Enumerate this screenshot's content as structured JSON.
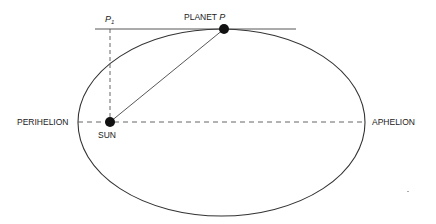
{
  "diagram": {
    "labels": {
      "planet_prefix": "PLANET ",
      "planet_var": "P",
      "p1_var": "P",
      "p1_sub": "1",
      "sun": "SUN",
      "perihelion": "PERIHELION",
      "aphelion": "APHELION"
    },
    "colors": {
      "stroke": "#333333",
      "body": "#111111",
      "background": "#ffffff"
    },
    "geometry": {
      "ellipse": {
        "cx": 221.5,
        "cy": 122.5,
        "rx": 143.5,
        "ry": 93.5
      },
      "sun": {
        "x": 110,
        "y": 122,
        "r": 5
      },
      "planet": {
        "x": 224,
        "y": 29,
        "r": 5
      },
      "tangent_line": {
        "x1": 95,
        "x2": 296,
        "y": 29
      },
      "major_axis": {
        "x1": 78,
        "x2": 365,
        "y": 122,
        "style": "dashed"
      },
      "p1_projection": {
        "x": 110,
        "y1": 29,
        "y2": 122,
        "style": "dashed"
      }
    }
  }
}
